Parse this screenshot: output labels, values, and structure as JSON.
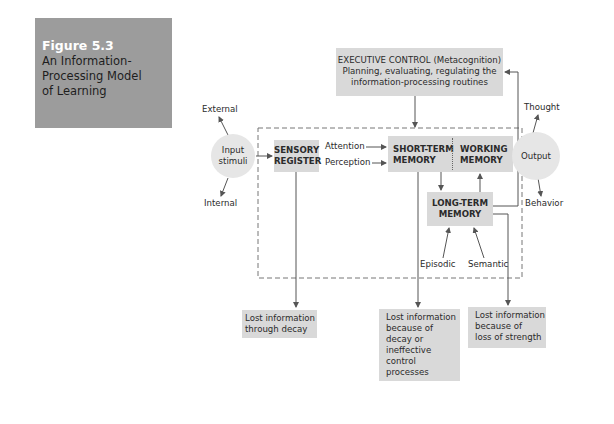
{
  "figure": {
    "number": "Figure 5.3",
    "title_lines": [
      "An Information-",
      "Processing Model",
      "of Learning"
    ]
  },
  "executive_control": {
    "line1": "EXECUTIVE CONTROL (Metacognition)",
    "line2": "Planning, evaluating, regulating the",
    "line3": "information-processing routines"
  },
  "input": {
    "external": "External",
    "internal": "Internal",
    "circle_line1": "Input",
    "circle_line2": "stimuli"
  },
  "sensory_register": {
    "line1": "SENSORY",
    "line2": "REGISTER"
  },
  "attention": "Attention",
  "perception": "Perception",
  "short_term_memory": {
    "line1": "SHORT-TERM",
    "line2": "MEMORY"
  },
  "working_memory": {
    "line1": "WORKING",
    "line2": "MEMORY"
  },
  "long_term_memory": {
    "line1": "LONG-TERM",
    "line2": "MEMORY"
  },
  "episodic": "Episodic",
  "semantic": "Semantic",
  "output": {
    "circle": "Output",
    "thought": "Thought",
    "behavior": "Behavior"
  },
  "losses": [
    {
      "lines": [
        "Lost information",
        "through decay"
      ]
    },
    {
      "lines": [
        "Lost information",
        "because of",
        "decay or",
        "ineffective",
        "control",
        "processes"
      ]
    },
    {
      "lines": [
        "Lost information",
        "because of",
        "loss of strength"
      ]
    }
  ],
  "colors": {
    "label_box": "#9c9c9c",
    "node_box": "#d9d9d9",
    "circle": "#e6e6e6",
    "line": "#555555"
  }
}
